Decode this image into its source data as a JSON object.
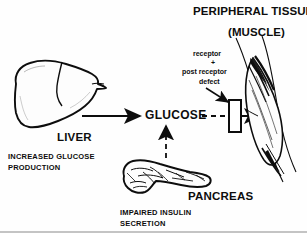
{
  "figure": {
    "kind": "medical-diagram",
    "background_color": "#fefefe",
    "ink_color": "#0d0d0d"
  },
  "titles": {
    "peripheral": "PERIPHERAL TISSUES",
    "muscle": "(MUSCLE)"
  },
  "annotation": {
    "line1": "receptor",
    "plus": "+",
    "line2": "post receptor",
    "line3": "defect"
  },
  "center": {
    "glucose": "GLUCOSE"
  },
  "liver": {
    "label": "LIVER",
    "caption_line1": "INCREASED GLUCOSE",
    "caption_line2": "PRODUCTION"
  },
  "pancreas": {
    "label": "PANCREAS",
    "caption_line1": "IMPAIRED INSULIN",
    "caption_line2": "SECRETION"
  },
  "arrows": {
    "liver_to_glucose": "solid-arrow-right",
    "pancreas_to_glucose": "dashed-arrow-up",
    "glucose_to_receptor": "dashed-line-right",
    "receptor_to_muscle": "solid-arrow-right",
    "defect_pointer": "diagonal-leader-arrow"
  },
  "shapes": {
    "receptor_block": "rectangle",
    "liver_organ": "liver-outline",
    "pancreas_organ": "pancreas-outline",
    "muscle_organ": "fusiform-muscle-belly",
    "limb_outline": "two-diagonal-lines"
  }
}
